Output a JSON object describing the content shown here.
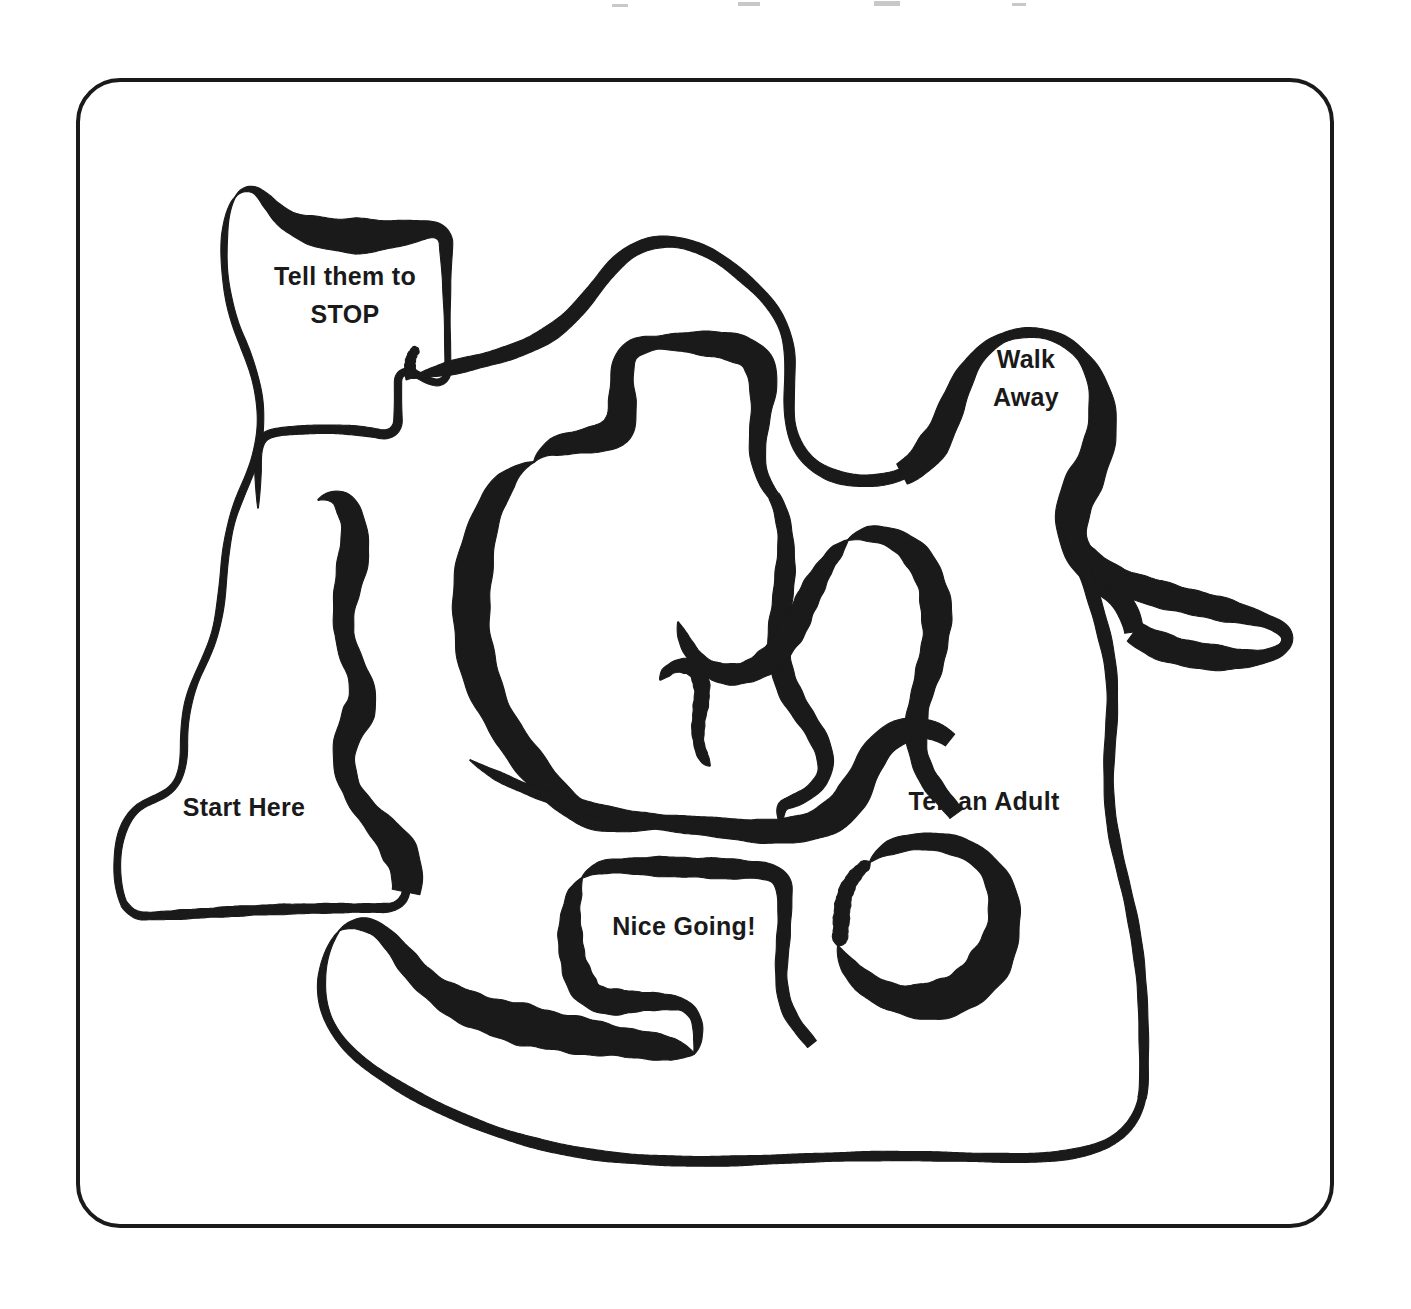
{
  "document": {
    "type": "maze-worksheet",
    "title": "Bullying Response Maze",
    "background_color": "#ffffff",
    "ink_color": "#1a1a1a",
    "frame": {
      "x": 78,
      "y": 80,
      "width": 1254,
      "height": 1146,
      "corner_radius": 42,
      "stroke_width": 4,
      "fill": "none"
    }
  },
  "labels": [
    {
      "id": "tell-them-to-stop",
      "lines": [
        "Tell them to",
        "STOP"
      ],
      "line1": "Tell them to",
      "line2": "STOP",
      "x": 345,
      "y": 285,
      "anchor": "middle",
      "line_height": 38,
      "role": "maze-cell-label"
    },
    {
      "id": "walk-away",
      "lines": [
        "Walk",
        "Away"
      ],
      "line1": "Walk",
      "line2": "Away",
      "x": 1026,
      "y": 368,
      "anchor": "middle",
      "line_height": 38,
      "role": "maze-cell-label"
    },
    {
      "id": "start-here",
      "lines": [
        "Start Here"
      ],
      "line1": "Start Here",
      "x": 244,
      "y": 816,
      "anchor": "middle",
      "line_height": 38,
      "role": "maze-entrance-label"
    },
    {
      "id": "tell-an-adult",
      "lines": [
        "Tell an Adult"
      ],
      "line1": "Tell an Adult",
      "x": 984,
      "y": 810,
      "anchor": "middle",
      "line_height": 38,
      "role": "maze-cell-label"
    },
    {
      "id": "nice-going",
      "lines": [
        "Nice Going!"
      ],
      "line1": "Nice Going!",
      "x": 684,
      "y": 935,
      "anchor": "middle",
      "line_height": 38,
      "role": "maze-goal-label"
    }
  ],
  "maze_walls": [
    {
      "id": "wall-stop-pocket",
      "note": "Closed pocket around the 'Tell them to STOP' cell, upper-left",
      "d": "M 236 196 C 240 190 250 186 258 192 C 268 200 276 214 290 222 C 310 232 334 236 360 236 C 386 236 408 232 424 230 C 436 228 444 232 446 242 L 448 370 C 448 378 442 384 434 382 C 424 380 418 374 412 372 C 404 370 398 374 398 382 L 398 420 C 398 430 390 436 380 434 C 360 430 334 428 300 430 C 284 431 272 432 266 436 C 260 440 258 448 258 458 L 258 508",
      "widths": [
        7,
        13,
        30,
        34,
        26,
        14,
        8,
        6,
        6,
        7,
        8,
        9,
        9,
        8,
        7,
        7
      ],
      "taper_start": true,
      "taper_end": true
    },
    {
      "id": "wall-stop-left-flank",
      "note": "Thin left wall descending from STOP pocket down past Start Here corridor",
      "d": "M 236 196 C 228 206 224 226 224 252 C 224 282 230 312 240 336 C 250 360 258 382 260 406 C 262 430 258 452 252 468 C 246 484 240 496 236 508 C 230 524 226 546 224 570 C 222 594 220 616 214 636 C 208 656 198 672 192 690 C 186 708 184 726 184 746 C 184 766 180 780 172 788 C 162 798 148 800 138 808 C 126 818 120 834 118 852 C 116 872 118 890 124 904",
      "widths": [
        6,
        6,
        7,
        7,
        7,
        7,
        7,
        7,
        7,
        7,
        7,
        7,
        7
      ],
      "taper_start": true,
      "taper_end": false
    },
    {
      "id": "wall-start-bowl",
      "note": "Bowl enclosing the Start Here cell (bottom-left)",
      "d": "M 124 904 C 130 912 136 916 144 916 C 170 916 212 912 264 910 C 316 908 360 908 384 908 C 396 908 404 902 406 892",
      "widths": [
        7,
        9,
        10,
        10,
        9,
        8
      ],
      "taper_start": false,
      "taper_end": false
    },
    {
      "id": "wall-start-right-thick",
      "note": "Heavy calligraphic wall right of Start Here, swelling downward",
      "d": "M 318 500 C 328 494 340 496 346 506 C 354 518 356 534 354 552 C 352 572 346 590 344 610 C 342 630 346 646 352 660 C 358 674 364 686 362 700 C 360 716 350 728 346 742 C 342 758 344 774 352 790 C 362 810 380 824 392 840 C 404 856 410 874 406 892",
      "widths": [
        9,
        24,
        30,
        26,
        18,
        22,
        30,
        24,
        18,
        26,
        34,
        30
      ],
      "taper_start": true,
      "taper_end": false
    },
    {
      "id": "wall-central-ridge-left",
      "note": "Left flank of the large central loop, thick on the descending diagonal",
      "d": "M 534 462 C 520 466 506 478 496 496 C 486 514 480 534 476 556 C 472 580 470 604 472 628 C 474 654 480 678 490 700 C 500 722 512 740 524 756 C 538 774 552 790 566 802 C 578 812 590 818 602 820 C 620 823 640 822 660 822 C 700 822 740 824 780 826",
      "widths": [
        9,
        26,
        34,
        38,
        36,
        32,
        30,
        26,
        20,
        14,
        10,
        9
      ],
      "taper_start": true,
      "taper_end": true
    },
    {
      "id": "wall-central-crown",
      "note": "Top crown of the central loop with the squared shoulder",
      "d": "M 534 462 C 540 452 552 446 566 444 C 590 440 612 438 618 428 C 624 418 622 400 622 380 C 622 362 626 350 640 346 C 658 340 686 342 712 344 C 732 346 748 350 756 360 C 764 370 764 386 762 404 C 760 424 756 442 758 458 C 760 474 766 486 774 496",
      "widths": [
        9,
        22,
        30,
        28,
        20,
        14,
        22,
        30,
        28,
        20,
        14,
        11
      ],
      "taper_start": true,
      "taper_end": false
    },
    {
      "id": "wall-central-right-descend",
      "note": "Right flank of central loop descending toward Tell an Adult area",
      "d": "M 774 496 C 782 510 786 530 786 552 C 786 576 782 600 780 624 C 778 648 780 670 788 688 C 796 706 808 720 816 734 C 824 748 828 762 824 774 C 818 790 802 798 786 804 C 778 807 782 820 780 826",
      "widths": [
        11,
        16,
        20,
        22,
        22,
        20,
        16,
        12,
        10
      ],
      "taper_start": false,
      "taper_end": true
    },
    {
      "id": "wall-central-inner-nub",
      "note": "Small inner nub / dead end at bottom of the central loop",
      "d": "M 660 680 C 666 670 676 664 686 666 C 696 668 702 678 702 690 C 702 704 698 718 698 732 C 698 746 702 758 710 766",
      "widths": [
        7,
        14,
        16,
        14,
        11,
        9
      ],
      "taper_start": true,
      "taper_end": true
    },
    {
      "id": "wall-upper-arc-left",
      "note": "Long thin arc from top-left pocket sweeping right across the top",
      "d": "M 412 378 C 430 372 452 368 476 362 C 502 356 526 348 546 336 C 566 324 580 308 594 290 C 608 272 620 256 638 248 C 654 240 674 240 692 246 C 712 252 728 264 744 278 C 758 290 770 302 778 316 C 786 330 790 346 790 364 C 790 384 788 404 790 420 C 792 436 798 450 808 460 C 820 472 836 478 852 480 C 870 482 888 480 902 474",
      "widths": [
        12,
        14,
        15,
        15,
        14,
        12,
        11,
        10,
        10,
        10,
        10,
        11,
        12,
        12
      ],
      "taper_start": true,
      "taper_end": false
    },
    {
      "id": "wall-walk-away-pocket",
      "note": "Rounded pocket enclosing Walk Away, heavy on the right shoulder",
      "d": "M 902 474 C 918 466 930 452 940 434 C 950 414 956 392 966 374 C 976 356 990 342 1008 336 C 1026 330 1046 332 1062 340 C 1080 350 1092 366 1098 386 C 1104 406 1104 428 1098 448 C 1092 468 1082 484 1076 500 C 1070 518 1070 536 1078 552 C 1086 568 1100 578 1112 590 C 1124 602 1132 616 1134 632",
      "widths": [
        22,
        30,
        26,
        16,
        10,
        9,
        12,
        22,
        32,
        36,
        32,
        26,
        22,
        20
      ],
      "taper_start": false,
      "taper_end": false
    },
    {
      "id": "wall-right-spur",
      "note": "Long tapering dead-end spur reaching to the right edge",
      "d": "M 1134 632 C 1150 644 1174 652 1202 656 C 1230 660 1256 660 1272 654 C 1284 650 1290 642 1286 634 C 1282 626 1266 620 1242 614 C 1214 607 1180 600 1152 592 C 1126 584 1106 574 1092 562 C 1078 550 1070 536 1068 520",
      "widths": [
        22,
        28,
        26,
        18,
        10,
        14,
        22,
        26,
        26,
        24,
        20,
        16
      ],
      "taper_start": false,
      "taper_end": true
    },
    {
      "id": "wall-midright-hook",
      "note": "Hook wall left of Tell an Adult, forming the mid-right corridor",
      "d": "M 848 540 C 862 532 880 532 896 540 C 914 549 926 566 932 586 C 938 606 938 628 934 648 C 930 670 922 690 918 710 C 914 732 916 752 924 770 C 932 788 946 800 956 814",
      "widths": [
        9,
        20,
        28,
        30,
        26,
        22,
        20,
        18,
        16
      ],
      "taper_start": true,
      "taper_end": false
    },
    {
      "id": "wall-midright-lower-swirl",
      "note": "Swirl connecting mid-right region down to the lower corridors",
      "d": "M 848 540 C 834 552 822 570 812 590 C 802 610 794 630 782 646 C 770 662 754 672 738 674 C 722 676 708 670 698 660 C 688 650 682 636 678 622",
      "widths": [
        9,
        18,
        24,
        26,
        24,
        20,
        14,
        9
      ],
      "taper_start": true,
      "taper_end": true
    },
    {
      "id": "wall-lower-central-band",
      "note": "Wide band sweeping across lower-middle, thick on the down-right diagonal",
      "d": "M 470 760 C 488 772 512 784 540 794 C 570 804 602 812 634 818 C 668 824 702 828 732 830 C 760 832 784 832 804 828 C 822 824 836 816 846 804 C 858 790 864 772 872 758 C 880 744 892 734 906 730 C 922 726 938 730 950 740",
      "widths": [
        7,
        10,
        12,
        13,
        14,
        15,
        18,
        24,
        30,
        32,
        28,
        22,
        16
      ],
      "taper_start": true,
      "taper_end": false
    },
    {
      "id": "wall-tell-adult-pocket",
      "note": "Pocket around Tell an Adult with the heavy hook below it",
      "d": "M 870 862 C 880 850 896 844 914 842 C 936 840 958 844 974 854 C 992 866 1002 884 1004 904 C 1006 926 1000 948 988 966 C 976 984 958 996 938 1000 C 916 1004 894 1000 876 990 C 858 980 844 964 838 946",
      "widths": [
        10,
        16,
        18,
        20,
        26,
        34,
        40,
        42,
        36,
        28,
        20,
        14
      ],
      "taper_start": true,
      "taper_end": true
    },
    {
      "id": "wall-tell-adult-left-stem",
      "note": "Left vertical stem beside Tell an Adult descending from the band",
      "d": "M 870 862 C 858 870 848 882 844 898 C 840 916 842 936 838 946",
      "widths": [
        10,
        14,
        16,
        14
      ],
      "taper_start": true,
      "taper_end": true
    },
    {
      "id": "wall-nice-going-box",
      "note": "Rectangular-ish enclosure around Nice Going!",
      "d": "M 582 878 C 590 870 602 866 616 866 C 656 866 712 868 756 870 C 772 871 782 876 784 888 C 786 904 784 930 782 956 C 780 978 782 996 788 1010 C 794 1024 804 1034 812 1044",
      "widths": [
        9,
        16,
        20,
        20,
        17,
        14,
        12,
        12,
        12
      ],
      "taper_start": true,
      "taper_end": false
    },
    {
      "id": "wall-nice-going-left-foot",
      "note": "Left wall and foot of the Nice Going box turning right",
      "d": "M 582 878 C 574 890 570 908 570 928 C 570 950 574 970 582 984 C 588 996 600 1002 616 1002 C 640 1002 664 1000 680 1004 C 692 1008 698 1018 698 1032 C 698 1044 696 1050 694 1054",
      "widths": [
        9,
        20,
        26,
        28,
        24,
        16,
        10,
        8
      ],
      "taper_start": true,
      "taper_end": true
    },
    {
      "id": "wall-bottom-left-hook",
      "note": "Hooked wall bottom-left with heavy down-right swell",
      "d": "M 340 930 C 352 922 366 922 378 930 C 392 940 402 956 414 970 C 428 986 446 998 468 1008 C 492 1018 520 1024 548 1030 C 578 1036 608 1040 636 1044 C 660 1047 680 1050 694 1054",
      "widths": [
        8,
        16,
        22,
        28,
        36,
        40,
        38,
        32,
        26,
        20
      ],
      "taper_start": true,
      "taper_end": true
    },
    {
      "id": "wall-bottom-outer-sweep",
      "note": "Thin outer sweep forming the bottom boundary of the maze",
      "d": "M 340 930 C 330 942 324 958 322 976 C 320 996 324 1014 334 1030 C 346 1050 366 1066 392 1082 C 420 1100 454 1116 492 1130 C 532 1144 576 1154 622 1158 C 668 1162 714 1162 760 1160 C 806 1158 852 1156 896 1156 C 940 1156 982 1158 1018 1158 C 1054 1158 1084 1154 1106 1144 C 1126 1134 1138 1118 1142 1098",
      "widths": [
        7,
        8,
        9,
        10,
        10,
        10,
        10,
        9,
        9,
        9,
        9,
        9,
        8
      ],
      "taper_start": true,
      "taper_end": false
    },
    {
      "id": "wall-right-outer-descend",
      "note": "Thin right-hand outer wall descending from the spur down to the bottom sweep",
      "d": "M 1068 520 C 1074 540 1082 562 1090 586 C 1098 612 1106 638 1110 664 C 1114 692 1112 718 1110 744 C 1108 772 1108 798 1112 824 C 1116 852 1124 878 1130 906 C 1136 934 1140 962 1142 990 C 1144 1020 1144 1052 1144 1074 C 1144 1088 1143 1094 1142 1098",
      "widths": [
        16,
        14,
        12,
        11,
        10,
        10,
        10,
        10,
        9,
        9
      ],
      "taper_start": false,
      "taper_end": false
    },
    {
      "id": "wall-upper-left-stub",
      "note": "Short stub descending from the upper-left arc into the mid area",
      "d": "M 412 378 C 408 366 410 354 418 348",
      "widths": [
        12,
        10,
        8
      ],
      "taper_start": false,
      "taper_end": true
    }
  ],
  "scan_artifacts": [
    {
      "x": 612,
      "y": 4,
      "width": 16,
      "height": 3
    },
    {
      "x": 738,
      "y": 2,
      "width": 22,
      "height": 4
    },
    {
      "x": 874,
      "y": 1,
      "width": 26,
      "height": 5
    },
    {
      "x": 1012,
      "y": 3,
      "width": 14,
      "height": 3
    }
  ]
}
